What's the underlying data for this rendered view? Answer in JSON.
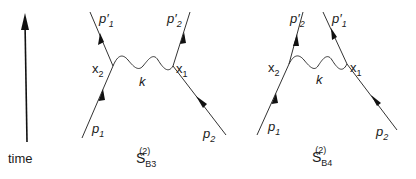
{
  "time_axis": {
    "label": "time"
  },
  "diagrams": [
    {
      "id": "SB3",
      "caption": {
        "base": "S",
        "sub": "B3",
        "sup": "(2)"
      },
      "vertices": {
        "left": "x",
        "left_sub": "2",
        "right": "x",
        "right_sub": "1"
      },
      "propagator": "k",
      "incoming": [
        {
          "p": "p",
          "sub": "1"
        },
        {
          "p": "p",
          "sub": "2"
        }
      ],
      "outgoing": [
        {
          "p": "p",
          "prime": "′",
          "sub": "1"
        },
        {
          "p": "p",
          "prime": "′",
          "sub": "2"
        }
      ]
    },
    {
      "id": "SB4",
      "caption": {
        "base": "S",
        "sub": "B4",
        "sup": "(2)"
      },
      "vertices": {
        "left": "x",
        "left_sub": "2",
        "right": "x",
        "right_sub": "1"
      },
      "propagator": "k",
      "incoming": [
        {
          "p": "p",
          "sub": "1"
        },
        {
          "p": "p",
          "sub": "2"
        }
      ],
      "outgoing": [
        {
          "p": "p",
          "prime": "′",
          "sub": "2"
        },
        {
          "p": "p",
          "prime": "′",
          "sub": "1"
        }
      ]
    }
  ],
  "colors": {
    "line": "#333333",
    "text": "#1a1a1a"
  }
}
